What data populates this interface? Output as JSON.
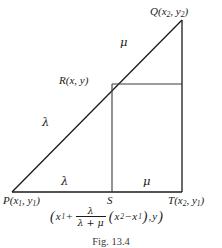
{
  "figure": {
    "caption": "Fig. 13.4",
    "background_color": "#ffffff",
    "stroke_color": "#1a1a1a",
    "points": {
      "P": {
        "label_main": "P",
        "label_open": "(",
        "x_sym": "x",
        "x_sub": "1",
        "comma": ", ",
        "y_sym": "y",
        "y_sub": "1",
        "label_close": ")"
      },
      "Q": {
        "label_main": "Q",
        "label_open": "(",
        "x_sym": "x",
        "x_sub": "2",
        "comma": ", ",
        "y_sym": "y",
        "y_sub": "2",
        "label_close": ")"
      },
      "T": {
        "label_main": "T",
        "label_open": "(",
        "x_sym": "x",
        "x_sub": "2",
        "comma": ", ",
        "y_sym": "y",
        "y_sub": "1",
        "label_close": ")"
      },
      "R": {
        "label_main": "R",
        "label_open": "(",
        "x_sym": "x",
        "comma": ", ",
        "y_sym": "y",
        "label_close": ")"
      },
      "S": {
        "label_main": "S"
      }
    },
    "ratio_labels": {
      "lambda_hypotenuse": "λ",
      "mu_hypotenuse": "μ",
      "lambda_base": "λ",
      "mu_base": "μ"
    },
    "coordinate_expression": {
      "open_paren": "(",
      "x1_sym": "x",
      "x1_sub": "1",
      "plus": "+",
      "fraction_numerator": "λ",
      "fraction_denominator": "λ + μ",
      "group_open": "(",
      "x2_sym": "x",
      "x2_sub": "2",
      "minus": "−",
      "x1b_sym": "x",
      "x1b_sub": "1",
      "group_close": ")",
      "comma": ",",
      "y_sym": "y",
      "close_paren": ")"
    },
    "geometry": {
      "P": [
        12,
        192
      ],
      "Q": [
        182,
        20
      ],
      "T": [
        182,
        192
      ],
      "R": [
        112,
        84
      ],
      "S": [
        112,
        192
      ],
      "right_edge_at_R": [
        182,
        84
      ]
    }
  }
}
